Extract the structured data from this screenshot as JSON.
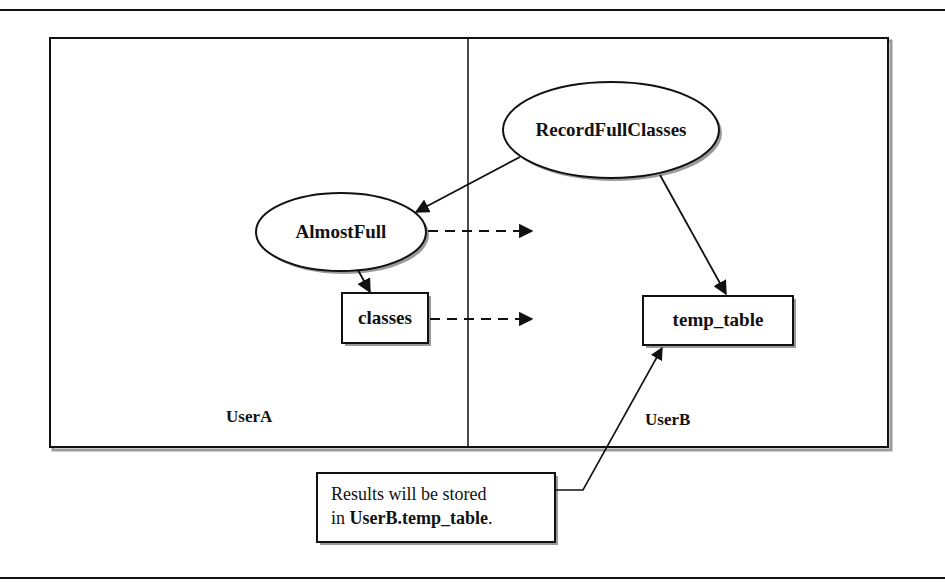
{
  "diagram": {
    "zones": {
      "left": {
        "label": "UserA"
      },
      "right": {
        "label": "UserB"
      }
    },
    "nodes": {
      "record_full_classes": {
        "label": "RecordFullClasses",
        "shape": "ellipse",
        "zone": "UserB"
      },
      "almost_full": {
        "label": "AlmostFull",
        "shape": "ellipse",
        "zone": "UserA"
      },
      "classes": {
        "label": "classes",
        "shape": "rectangle",
        "zone": "UserA"
      },
      "temp_table": {
        "label": "temp_table",
        "shape": "rectangle",
        "zone": "UserB"
      }
    },
    "edges": [
      {
        "from": "RecordFullClasses",
        "to": "AlmostFull",
        "style": "solid"
      },
      {
        "from": "RecordFullClasses",
        "to": "temp_table",
        "style": "solid"
      },
      {
        "from": "AlmostFull",
        "to": "classes",
        "style": "solid"
      },
      {
        "from": "AlmostFull",
        "to": "UserB",
        "style": "dashed"
      },
      {
        "from": "classes",
        "to": "UserB",
        "style": "dashed"
      }
    ],
    "callout": {
      "line1": "Results will be stored",
      "line2_prefix": "in ",
      "line2_bold": "UserB.temp_table",
      "line2_suffix": ".",
      "points_to": "temp_table"
    },
    "colors": {
      "stroke": "#111111",
      "shadow": "#9a9a9a",
      "background": "#ffffff"
    }
  }
}
